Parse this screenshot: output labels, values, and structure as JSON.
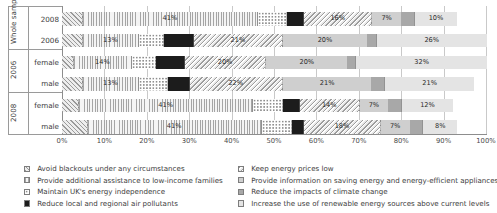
{
  "chart_data": {
    "type": "bar",
    "subtype": "stacked-horizontal-100pct",
    "title": "",
    "xlabel": "",
    "ylabel": "",
    "xlim": [
      0,
      100
    ],
    "xticks": [
      "0%",
      "10%",
      "20%",
      "30%",
      "40%",
      "50%",
      "60%",
      "70%",
      "80%",
      "90%",
      "100%"
    ],
    "grid": true,
    "legend_position": "bottom",
    "groups": [
      {
        "group_label": "Whole sample",
        "rows": [
          "2008",
          "2006"
        ]
      },
      {
        "group_label": "2006",
        "rows": [
          "female",
          "male"
        ]
      },
      {
        "group_label": "2008",
        "rows": [
          "female",
          "male"
        ]
      }
    ],
    "categories": [
      "2008",
      "2006",
      "female",
      "male",
      "female",
      "male"
    ],
    "series": [
      {
        "name": "Avoid blackouts under any circumstances",
        "pattern": "diagonal-hatch",
        "values": [
          5,
          5,
          3,
          5,
          4,
          6
        ]
      },
      {
        "name": "Provide additional assistance to low-income families",
        "pattern": "vertical-stripes",
        "values": [
          41,
          13,
          14,
          13,
          41,
          41
        ]
      },
      {
        "name": "Maintain UK's energy independence",
        "pattern": "dotted",
        "values": [
          7,
          6,
          6,
          7,
          7,
          7
        ]
      },
      {
        "name": "Reduce local and regional air pollutants",
        "pattern": "solid-dark",
        "values": [
          4,
          7,
          7,
          5,
          4,
          3
        ]
      },
      {
        "name": "Keep energy prices low",
        "pattern": "reverse-diagonal-hatch",
        "values": [
          16,
          21,
          20,
          22,
          14,
          18
        ]
      },
      {
        "name": "Provide information on saving energy and energy-efficient appliances",
        "pattern": "medium-grey",
        "values": [
          7,
          20,
          20,
          21,
          7,
          7
        ]
      },
      {
        "name": "Reduce the impacts of climate change",
        "pattern": "dark-grey",
        "values": [
          3,
          2,
          2,
          3,
          3,
          3
        ]
      },
      {
        "name": "Increase the use of renewable energy sources above current levels",
        "pattern": "light-grey",
        "values": [
          10,
          26,
          32,
          21,
          12,
          8
        ]
      }
    ],
    "bar_labels": [
      [
        "",
        "41%",
        "",
        "",
        "16%",
        "7%",
        "",
        "10%"
      ],
      [
        "",
        "13%",
        "",
        "",
        "21%",
        "20%",
        "",
        "26%"
      ],
      [
        "",
        "14%",
        "",
        "",
        "20%",
        "20%",
        "",
        "32%"
      ],
      [
        "",
        "13%",
        "",
        "",
        "22%",
        "21%",
        "",
        "21%"
      ],
      [
        "",
        "41%",
        "",
        "",
        "14%",
        "7%",
        "",
        "12%"
      ],
      [
        "",
        "41%",
        "",
        "",
        "18%",
        "7%",
        "",
        "8%"
      ]
    ]
  },
  "legend": {
    "left_column": [
      "Avoid blackouts under any circumstances",
      "Provide additional assistance to low-income families",
      "Maintain UK's energy independence",
      "Reduce local and regional air pollutants"
    ],
    "right_column": [
      "Keep energy prices low",
      "Provide information on saving energy and energy-efficient appliances",
      "Reduce the impacts of climate change",
      "Increase the use of renewable energy sources above current levels"
    ]
  }
}
